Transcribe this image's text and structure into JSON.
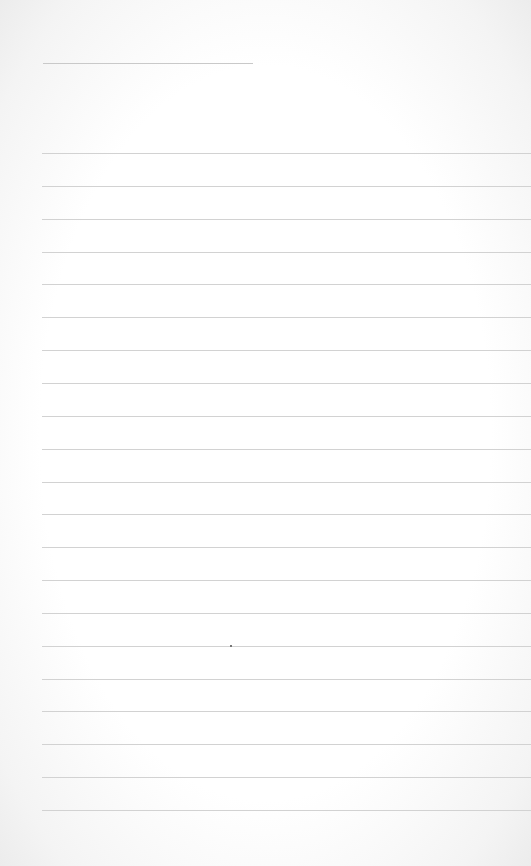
{
  "page": {
    "type": "lined-notepaper",
    "background_color": "#ffffff",
    "line_color": "#d2d2d2",
    "header_line": {
      "top": 63,
      "left": 43,
      "width": 210
    },
    "ruled_lines": {
      "count": 21,
      "first_top": 153,
      "spacing": 32.85,
      "left": 42
    },
    "text_content": []
  }
}
